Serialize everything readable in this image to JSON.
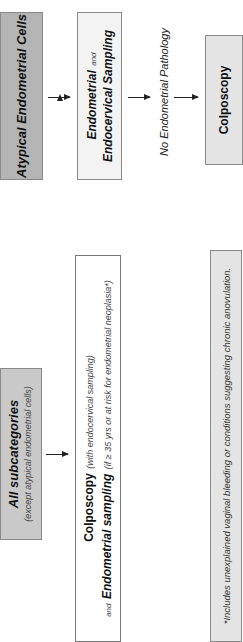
{
  "top_left_panel": {
    "title": "Atypical Endometrial Cells",
    "step2_bold1": "Endometrial",
    "step2_and": "and",
    "step2_bold2": "Endocervical Sampling",
    "condition": "No Endometrial Pathology",
    "step3": "Colposcopy"
  },
  "bottom_panel": {
    "title": "All subcategories",
    "subtitle": "(except atypical endometrial cells)",
    "line1_bold": "Colposcopy",
    "line1_note": "(with endocervical sampling)",
    "line2_and": "and",
    "line2_bold": "Endometrial sampling",
    "line2_note": "(if ≥ 35 yrs or at risk for endometrial neoplasia*)"
  },
  "footnote": "*Includes unexplained vaginal bleeding or conditions suggesting chronic anovulation.",
  "colors": {
    "dark_box": "#b4b4b4",
    "mid_box": "#c9c9c9",
    "light_box": "#f3f3f3",
    "border": "#8a8a8a"
  }
}
